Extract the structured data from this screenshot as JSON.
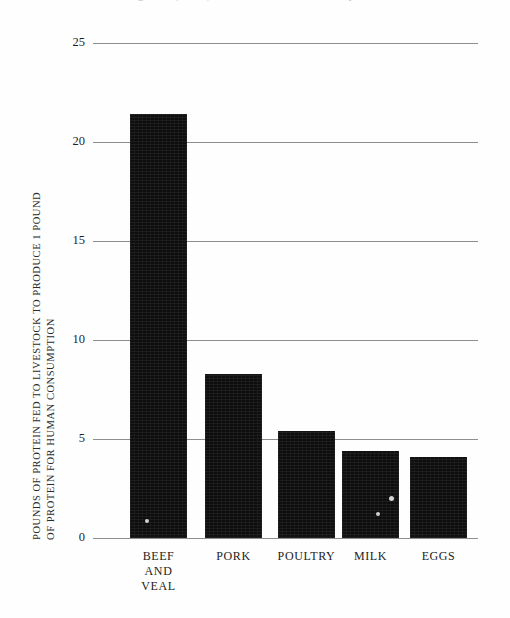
{
  "figure": {
    "cut_off_caption": "Figure 3. (above) Protein conversion efficiency",
    "background_color": "#fefefe",
    "bar_color": "#0d0d0d",
    "gridline_color": "#8d8d92"
  },
  "axis": {
    "y_title_line1": "POUNDS OF PROTEIN FED TO LIVESTOCK TO PRODUCE 1 POUND",
    "y_title_line2": "OF PROTEIN FOR HUMAN CONSUMPTION",
    "y_ticks": [
      "0",
      "5",
      "10",
      "15",
      "20",
      "25"
    ]
  },
  "chart_data": {
    "type": "bar",
    "title": "",
    "xlabel": "",
    "ylabel": "POUNDS OF PROTEIN FED TO LIVESTOCK TO PRODUCE 1 POUND OF PROTEIN FOR HUMAN CONSUMPTION",
    "categories": [
      "BEEF AND VEAL",
      "PORK",
      "POULTRY",
      "MILK",
      "EGGS"
    ],
    "category_lines": [
      [
        "BEEF",
        "AND",
        "VEAL"
      ],
      [
        "PORK"
      ],
      [
        "POULTRY"
      ],
      [
        "MILK"
      ],
      [
        "EGGS"
      ]
    ],
    "values": [
      21.4,
      8.3,
      5.4,
      4.4,
      4.1
    ],
    "ylim": [
      0,
      25
    ],
    "ytick_step": 5,
    "grid": true,
    "legend": false
  }
}
